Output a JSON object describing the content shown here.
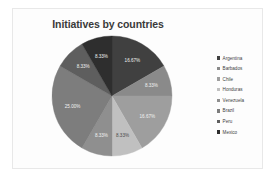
{
  "chart": {
    "title": "Initiatives by countries",
    "background": "#fdfdfd",
    "border_color": "#e8e8e8"
  },
  "legend": {
    "position": "right",
    "items": [
      {
        "label": "Argentina",
        "color": "#404040"
      },
      {
        "label": "Barbados",
        "color": "#8a8a8a"
      },
      {
        "label": "Chile",
        "color": "#9e9e9e"
      },
      {
        "label": "Honduras",
        "color": "#c0c0c0"
      },
      {
        "label": "Venezuela",
        "color": "#8f8f8f"
      },
      {
        "label": "Brazil",
        "color": "#7d7d7d"
      },
      {
        "label": "Peru",
        "color": "#5e5e5e"
      },
      {
        "label": "Mexico",
        "color": "#2e2e2e"
      }
    ]
  },
  "chart_data": {
    "type": "pie",
    "title": "Initiatives by countries",
    "xlabel": "",
    "ylabel": "",
    "legend_position": "right",
    "grid": false,
    "categories": [
      "Argentina",
      "Barbados",
      "Chile",
      "Honduras",
      "Venezuela",
      "Brazil",
      "Peru",
      "Mexico"
    ],
    "values": [
      16.67,
      8.33,
      16.67,
      8.33,
      8.33,
      25.0,
      8.33,
      8.33
    ],
    "labels": [
      "16.67%",
      "8.33%",
      "16.67%",
      "8.33%",
      "8.33%",
      "25.00%",
      "8.33%",
      "8.33%"
    ],
    "colors": [
      "#404040",
      "#8a8a8a",
      "#9e9e9e",
      "#c0c0c0",
      "#8f8f8f",
      "#7d7d7d",
      "#5e5e5e",
      "#2e2e2e"
    ],
    "label_text_colors": [
      "light",
      "light",
      "light",
      "dark",
      "light",
      "light",
      "light",
      "light"
    ],
    "units": "percent",
    "total": 100
  }
}
